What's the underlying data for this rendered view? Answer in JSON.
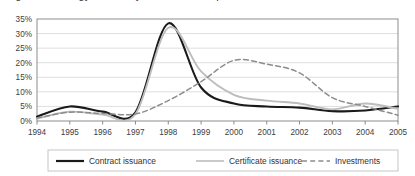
{
  "chart_data": {
    "type": "line",
    "title": "",
    "xlabel": "",
    "ylabel": "",
    "categories": [
      1994,
      1995,
      1996,
      1997,
      1998,
      1999,
      2000,
      2001,
      2002,
      2003,
      2004,
      2005
    ],
    "x_tick_labels": [
      "1994",
      "1995",
      "1996",
      "1997",
      "1998",
      "1999",
      "2000",
      "2001",
      "2002",
      "2003",
      "2004",
      "2005"
    ],
    "y_tick_labels": [
      "0%",
      "5%",
      "10%",
      "15%",
      "20%",
      "25%",
      "30%",
      "35%"
    ],
    "y_tick_values": [
      0,
      5,
      10,
      15,
      20,
      25,
      30,
      35
    ],
    "ylim": [
      0,
      35
    ],
    "y_unit": "%",
    "grid": "horizontal",
    "legend_position": "bottom",
    "series": [
      {
        "name": "Contract issuance",
        "style": "solid",
        "color": "#1a1a1a",
        "width": 2.1,
        "values": [
          1.5,
          5.0,
          3.2,
          3.0,
          33.5,
          11.5,
          6.0,
          5.0,
          4.6,
          3.4,
          3.6,
          5.0
        ]
      },
      {
        "name": "Certificate issuance",
        "style": "solid",
        "color": "#bdbdbd",
        "width": 1.9,
        "values": [
          0.8,
          3.2,
          2.2,
          2.4,
          32.0,
          17.0,
          9.0,
          7.0,
          6.0,
          4.0,
          6.0,
          4.2
        ]
      },
      {
        "name": "Investments",
        "style": "dashed",
        "color": "#8c8c8c",
        "width": 1.5,
        "values": [
          1.0,
          3.0,
          2.6,
          2.4,
          7.0,
          13.5,
          20.8,
          19.5,
          16.5,
          8.0,
          5.0,
          2.0
        ]
      }
    ]
  },
  "axes": {
    "plot_left": 37,
    "plot_top": 19,
    "plot_right": 398,
    "plot_bottom": 121,
    "border_color": "#808080",
    "grid_color": "#d6d6d6"
  },
  "legend": {
    "border_color": "#bfbfbf",
    "items": [
      {
        "label": "Contract issuance",
        "color": "#1a1a1a",
        "style": "solid",
        "width": 2.2
      },
      {
        "label": "Certificate issuance",
        "color": "#c4c4c4",
        "style": "solid",
        "width": 1.8
      },
      {
        "label": "Investments",
        "color": "#8c8c8c",
        "style": "dashed",
        "width": 1.5
      }
    ]
  },
  "clipped_header": {
    "text": "Figure 2. Energy efficiency market development"
  }
}
